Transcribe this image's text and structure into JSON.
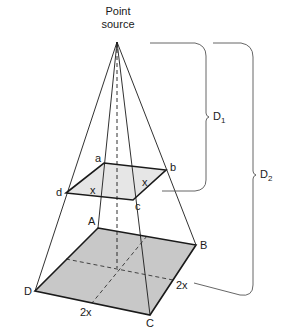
{
  "figure": {
    "source_label_line1": "Point",
    "source_label_line2": "source",
    "small_square": {
      "vertices": {
        "a": "a",
        "b": "b",
        "c": "c",
        "d": "d"
      },
      "side_label_1": "x",
      "side_label_2": "x"
    },
    "large_square": {
      "vertices": {
        "A": "A",
        "B": "B",
        "C": "C",
        "D": "D"
      },
      "side_label_1": "2x",
      "side_label_2": "2x"
    },
    "distances": {
      "d1": {
        "main": "D",
        "sub": "1"
      },
      "d2": {
        "main": "D",
        "sub": "2"
      }
    },
    "colors": {
      "line": "#1a1a1a",
      "small_fill": "#e6e6e6",
      "large_fill": "#c8c8c8",
      "bracket": "#555555"
    }
  }
}
